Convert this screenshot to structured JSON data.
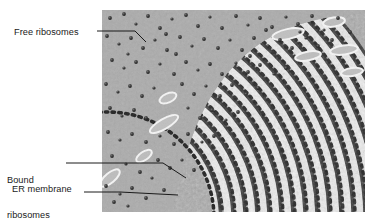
{
  "figure": {
    "type": "electron-micrograph-labeled-diagram",
    "background_color": "#ffffff",
    "canvas": {
      "width": 375,
      "height": 222
    }
  },
  "micrograph": {
    "alt": "Transmission electron micrograph of cytoplasm showing free ribosomes and concentric rough endoplasmic reticulum membranes studded with bound ribosomes",
    "bounds": {
      "x": 102,
      "y": 10,
      "width": 263,
      "height": 202
    },
    "cytoplasm_color": "#a9a9a9",
    "membrane_dark_color": "#2e2e2e",
    "lumen_light_color": "#f2f2f2",
    "ribosome_color": "#2a2a2a",
    "free_ribosome_count": 168,
    "er_arc_count": 17,
    "arc_center": {
      "x": 6,
      "y": 208
    }
  },
  "labels": {
    "free_ribosomes": {
      "text": "Free ribosomes",
      "leader": {
        "x1": 97,
        "y1": 31,
        "x2": 135,
        "y2": 31,
        "x3": 146,
        "y3": 42
      }
    },
    "bound_ribosomes": {
      "line1": "Bound",
      "line2": "ribosomes",
      "leader": {
        "x1": 66,
        "y1": 163,
        "x2": 163,
        "y2": 163,
        "x3": 186,
        "y3": 178
      }
    },
    "er_membrane": {
      "text": "ER membrane",
      "leader": {
        "x1": 84,
        "y1": 192,
        "x2": 120,
        "y2": 192,
        "x3": 178,
        "y3": 195
      }
    }
  },
  "colors": {
    "text": "#1a1a1a",
    "leader_line": "#1a1a1a",
    "page_background": "#ffffff"
  }
}
